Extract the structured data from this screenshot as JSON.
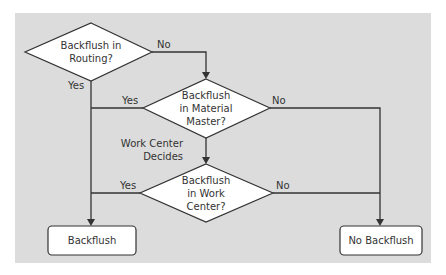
{
  "diagram": {
    "type": "flowchart",
    "background_color": "#dcdcdc",
    "nodes": [
      {
        "id": "d1",
        "shape": "diamond",
        "lines": [
          "Backflush in",
          "Routing?"
        ]
      },
      {
        "id": "d2",
        "shape": "diamond",
        "lines": [
          "Backflush",
          "in Material",
          "Master?"
        ]
      },
      {
        "id": "d3",
        "shape": "diamond",
        "lines": [
          "Backflush",
          "in Work",
          "Center?"
        ]
      },
      {
        "id": "r1",
        "shape": "rounded-rect",
        "label": "Backflush"
      },
      {
        "id": "r2",
        "shape": "rounded-rect",
        "label": "No Backflush"
      }
    ],
    "edges": [
      {
        "from": "d1",
        "to": "d2",
        "label": "No"
      },
      {
        "from": "d1",
        "to": "r1",
        "label": "Yes"
      },
      {
        "from": "d2",
        "to": "r1",
        "label": "Yes"
      },
      {
        "from": "d2",
        "to": "r2",
        "label": "No"
      },
      {
        "from": "d2",
        "to": "d3",
        "label": [
          "Work Center",
          "Decides"
        ]
      },
      {
        "from": "d3",
        "to": "r1",
        "label": "Yes"
      },
      {
        "from": "d3",
        "to": "r2",
        "label": "No"
      }
    ]
  }
}
